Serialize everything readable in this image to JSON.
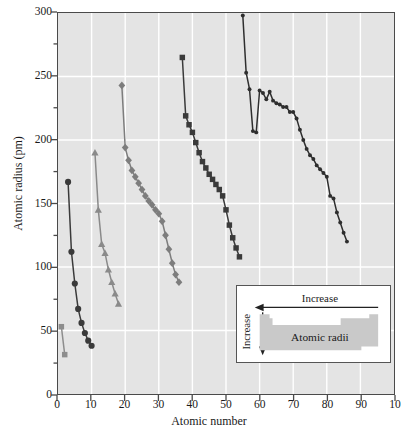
{
  "chart_data": {
    "type": "line",
    "title": "",
    "xlabel": "Atomic number",
    "ylabel": "Atomic radius (pm)",
    "xlim": [
      0,
      100
    ],
    "ylim": [
      0,
      300
    ],
    "xticks": [
      "0",
      "10",
      "20",
      "30",
      "40",
      "50",
      "60",
      "70",
      "80",
      "90",
      "10"
    ],
    "yticks": [
      "0",
      "50",
      "100",
      "150",
      "200",
      "250",
      "300"
    ],
    "xtick_values": [
      0,
      10,
      20,
      30,
      40,
      50,
      60,
      70,
      80,
      90,
      100
    ],
    "ytick_values": [
      0,
      50,
      100,
      150,
      200,
      250,
      300
    ],
    "grid": "white gridlines on gray panel, major x every 10, major y every 50",
    "minor_ticks": "y minor ticks every 25 on left spine",
    "legend": "none",
    "series": [
      {
        "name": "Period 1",
        "marker": "square",
        "color": "#8d8d8d",
        "x": [
          1,
          2
        ],
        "y": [
          53,
          31
        ]
      },
      {
        "name": "Period 2",
        "marker": "circle",
        "color": "#3a3a3a",
        "x": [
          3,
          4,
          5,
          6,
          7,
          8,
          9,
          10
        ],
        "y": [
          167,
          112,
          87,
          67,
          56,
          48,
          42,
          38
        ]
      },
      {
        "name": "Period 3",
        "marker": "triangle",
        "color": "#8a8a8a",
        "x": [
          11,
          12,
          13,
          14,
          15,
          16,
          17,
          18
        ],
        "y": [
          190,
          145,
          118,
          111,
          98,
          88,
          79,
          71
        ]
      },
      {
        "name": "Period 4",
        "marker": "diamond",
        "color": "#7d7d7d",
        "x": [
          19,
          20,
          21,
          22,
          23,
          24,
          25,
          26,
          27,
          28,
          29,
          30,
          31,
          32,
          33,
          34,
          35,
          36
        ],
        "y": [
          243,
          194,
          184,
          176,
          171,
          166,
          161,
          156,
          152,
          149,
          145,
          142,
          136,
          125,
          114,
          103,
          94,
          88
        ]
      },
      {
        "name": "Period 5",
        "marker": "square",
        "color": "#3a3a3a",
        "x": [
          37,
          38,
          39,
          40,
          41,
          42,
          43,
          44,
          45,
          46,
          47,
          48,
          49,
          50,
          51,
          52,
          53,
          54
        ],
        "y": [
          265,
          219,
          212,
          206,
          198,
          190,
          183,
          178,
          173,
          169,
          165,
          161,
          156,
          145,
          133,
          123,
          115,
          108
        ]
      },
      {
        "name": "Period 6",
        "marker": "circle",
        "color": "#2e2e2e",
        "x": [
          55,
          56,
          57,
          58,
          59,
          60,
          61,
          62,
          63,
          64,
          65,
          66,
          67,
          68,
          69,
          70,
          71,
          72,
          73,
          74,
          75,
          76,
          77,
          78,
          79,
          80,
          81,
          82,
          83,
          84,
          85,
          86
        ],
        "y": [
          298,
          253,
          240,
          207,
          206,
          239,
          237,
          232,
          238,
          231,
          229,
          228,
          226,
          226,
          222,
          222,
          217,
          208,
          200,
          193,
          188,
          185,
          180,
          177,
          174,
          171,
          156,
          154,
          143,
          135,
          127,
          120
        ]
      }
    ]
  },
  "inset": {
    "arrow_top_label": "Increase",
    "arrow_left_label": "Increase",
    "body_label": "Atomic radii"
  }
}
